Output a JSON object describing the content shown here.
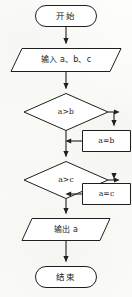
{
  "diagram": {
    "kind": "flowchart",
    "stroke_color": "#1f1f1f",
    "fill_color": "#ffffff",
    "background_color": "#fcfcfa",
    "nodes": {
      "start": {
        "label": "开始",
        "shape": "terminator"
      },
      "input": {
        "label": "输入 a、b、c",
        "shape": "parallelogram"
      },
      "decision_ab": {
        "label": "a>b",
        "shape": "diamond"
      },
      "assign_ab": {
        "label": "a=b",
        "shape": "rectangle"
      },
      "decision_ac": {
        "label": "a>c",
        "shape": "diamond"
      },
      "assign_ac": {
        "label": "a=c",
        "shape": "rectangle"
      },
      "output": {
        "label": "输出 a",
        "shape": "parallelogram"
      },
      "end": {
        "label": "结束",
        "shape": "terminator"
      }
    }
  }
}
